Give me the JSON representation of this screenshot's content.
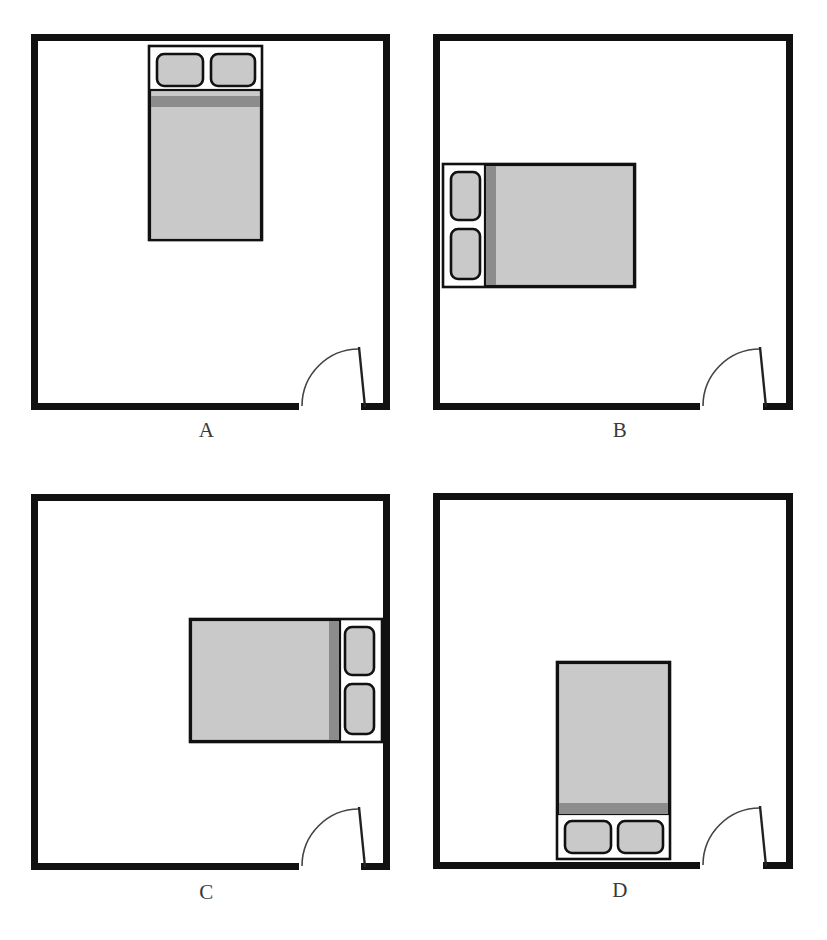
{
  "figure": {
    "width": 827,
    "height": 940,
    "background_color": "#ffffff",
    "panel_count": 4,
    "grid": "2x2"
  },
  "colors": {
    "wall": "#111111",
    "bed_outline": "#111111",
    "mattress_fill": "#c9c9c9",
    "blanket_band": "#8c8c8c",
    "pillow_fill": "#c9c9c9",
    "pillow_outline": "#111111",
    "bed_frame_fill": "#ffffff",
    "door_arc": "#444444",
    "label_text": "#3a3a3a",
    "room_floor": "#ffffff"
  },
  "legend": {
    "room_shape": "square enclosed room with thick black walls",
    "door_description": "single swing door at bottom-right wall with quarter-circle swing arc",
    "bed_description": "double bed: light grey mattress, dark grey blanket band, white pillow shelf with two rounded pillows"
  },
  "panels": [
    {
      "id": "A",
      "label": "A",
      "room": {
        "x": 31,
        "y": 34,
        "width": 359,
        "height": 376,
        "wall_thickness": 7
      },
      "door": {
        "gap_start": 299,
        "gap_end": 361,
        "hinge_side": "left",
        "swing": "inward-up",
        "leaf_top_x": 359,
        "leaf_top_y": 346
      },
      "bed": {
        "orientation": "vertical",
        "pillow_edge": "top",
        "x": 149,
        "y": 46,
        "width": 113,
        "height": 194,
        "pillow_band": 44,
        "blanket_band": 11,
        "pillows": 2,
        "against_wall": "top"
      }
    },
    {
      "id": "B",
      "label": "B",
      "room": {
        "x": 433,
        "y": 34,
        "width": 360,
        "height": 376,
        "wall_thickness": 7
      },
      "door": {
        "gap_start": 700,
        "gap_end": 763,
        "hinge_side": "left",
        "swing": "inward-up",
        "leaf_top_x": 761,
        "leaf_top_y": 346
      },
      "bed": {
        "orientation": "horizontal",
        "pillow_edge": "left",
        "x": 443,
        "y": 164,
        "width": 192,
        "height": 123,
        "pillow_band": 42,
        "blanket_band": 10,
        "pillows": 2,
        "against_wall": "left"
      }
    },
    {
      "id": "C",
      "label": "C",
      "room": {
        "x": 31,
        "y": 494,
        "width": 359,
        "height": 376,
        "wall_thickness": 7
      },
      "door": {
        "gap_start": 299,
        "gap_end": 361,
        "hinge_side": "left",
        "swing": "inward-up",
        "leaf_top_x": 359,
        "leaf_top_y": 806
      },
      "bed": {
        "orientation": "horizontal",
        "pillow_edge": "right",
        "x": 190,
        "y": 619,
        "width": 192,
        "height": 123,
        "pillow_band": 42,
        "blanket_band": 10,
        "pillows": 2,
        "against_wall": "right"
      }
    },
    {
      "id": "D",
      "label": "D",
      "room": {
        "x": 433,
        "y": 493,
        "width": 360,
        "height": 376,
        "wall_thickness": 7
      },
      "door": {
        "gap_start": 700,
        "gap_end": 763,
        "hinge_side": "left",
        "swing": "inward-up",
        "leaf_top_x": 761,
        "leaf_top_y": 806
      },
      "bed": {
        "orientation": "vertical",
        "pillow_edge": "bottom",
        "x": 557,
        "y": 662,
        "width": 113,
        "height": 197,
        "pillow_band": 44,
        "blanket_band": 11,
        "pillows": 2,
        "against_wall": "bottom"
      }
    }
  ]
}
